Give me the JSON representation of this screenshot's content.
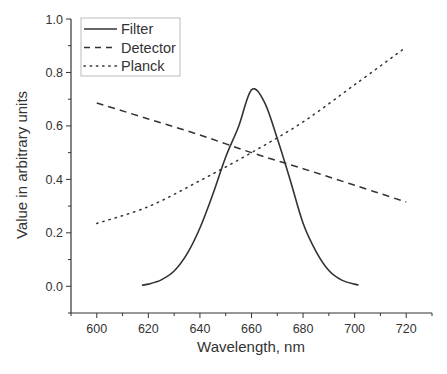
{
  "chart_data": {
    "type": "line",
    "title": "",
    "xlabel": "Wavelength, nm",
    "ylabel": "Value in arbitrary units",
    "xlim": [
      590,
      730
    ],
    "ylim": [
      -0.1,
      1.0
    ],
    "x_ticks": [
      600,
      620,
      640,
      660,
      680,
      700,
      720
    ],
    "x_tick_labels": [
      "600",
      "620",
      "640",
      "660",
      "680",
      "700",
      "720"
    ],
    "y_ticks": [
      0.0,
      0.2,
      0.4,
      0.6,
      0.8,
      1.0
    ],
    "y_tick_labels": [
      "0.0",
      "0.2",
      "0.4",
      "0.6",
      "0.8",
      "1.0"
    ],
    "grid": false,
    "legend_position": "upper left",
    "series": [
      {
        "name": "Filter",
        "style": "solid",
        "x": [
          617.5,
          620,
          625,
          630,
          635,
          640,
          645,
          650,
          655,
          660,
          665,
          670,
          675,
          680,
          685,
          690,
          695,
          700,
          701.5
        ],
        "y": [
          0.004,
          0.008,
          0.024,
          0.057,
          0.121,
          0.218,
          0.344,
          0.484,
          0.598,
          0.735,
          0.689,
          0.553,
          0.398,
          0.236,
          0.131,
          0.059,
          0.023,
          0.008,
          0.005
        ]
      },
      {
        "name": "Detector",
        "style": "dashed",
        "x": [
          600,
          620,
          640,
          660,
          680,
          700,
          720
        ],
        "y": [
          0.686,
          0.626,
          0.566,
          0.5,
          0.44,
          0.378,
          0.315
        ]
      },
      {
        "name": "Planck",
        "style": "dotted",
        "x": [
          600,
          620,
          640,
          660,
          680,
          700,
          720
        ],
        "y": [
          0.235,
          0.298,
          0.395,
          0.5,
          0.615,
          0.754,
          0.895
        ]
      }
    ]
  },
  "legend": {
    "items": [
      {
        "label": "Filter",
        "style": "solid"
      },
      {
        "label": "Detector",
        "style": "dashed"
      },
      {
        "label": "Planck",
        "style": "dotted"
      }
    ]
  },
  "colors": {
    "line": "#333333",
    "axis": "#333333",
    "legend_border": "#bbbbbb"
  }
}
